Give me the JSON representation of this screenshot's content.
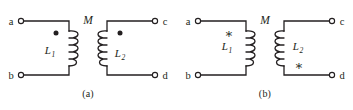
{
  "figure": {
    "background_color": "#ffffff",
    "ink_color": "#231f20",
    "panels": [
      {
        "id": "a",
        "caption": "(a)",
        "mutual_label": "M",
        "marker_type": "dot",
        "marker_glyph": "●",
        "terminals": [
          {
            "id": "a",
            "label": "a",
            "position": "top-left"
          },
          {
            "id": "c",
            "label": "c",
            "position": "top-right"
          },
          {
            "id": "b",
            "label": "b",
            "position": "bottom-left"
          },
          {
            "id": "d",
            "label": "d",
            "position": "bottom-right"
          }
        ],
        "inductors": [
          {
            "id": "L1",
            "base": "L",
            "subscript": "1",
            "side": "left",
            "label_side": "left",
            "marker_position": "top"
          },
          {
            "id": "L2",
            "base": "L",
            "subscript": "2",
            "side": "right",
            "label_side": "right",
            "marker_position": "top"
          }
        ]
      },
      {
        "id": "b",
        "caption": "(b)",
        "mutual_label": "M",
        "marker_type": "asterisk",
        "marker_glyph": "∗",
        "terminals": [
          {
            "id": "a",
            "label": "a",
            "position": "top-left"
          },
          {
            "id": "c",
            "label": "c",
            "position": "top-right"
          },
          {
            "id": "b",
            "label": "b",
            "position": "bottom-left"
          },
          {
            "id": "d",
            "label": "d",
            "position": "bottom-right"
          }
        ],
        "inductors": [
          {
            "id": "L1",
            "base": "L",
            "subscript": "1",
            "side": "left",
            "label_side": "left",
            "marker_position": "top"
          },
          {
            "id": "L2",
            "base": "L",
            "subscript": "2",
            "side": "right",
            "label_side": "right",
            "marker_position": "bottom"
          }
        ]
      }
    ]
  }
}
